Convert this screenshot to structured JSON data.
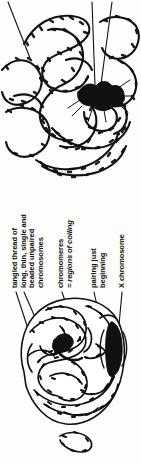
{
  "figure": {
    "ink_color": "#111111",
    "background_color": "#fdfdfb",
    "orientation": "labels rotated 90 degrees counter-clockwise"
  },
  "labels": [
    {
      "id": "tangled",
      "name": "label-tangled-thread",
      "lines": [
        "tangled thread of",
        "long, thin, single and",
        "beaded unpaired",
        "chromosomes"
      ],
      "italic_lines": []
    },
    {
      "id": "chromomeres",
      "name": "label-chromomeres",
      "lines": [
        "chromomeres",
        "= regions of coiling"
      ],
      "italic_lines": [
        1
      ]
    },
    {
      "id": "pairing",
      "name": "label-pairing-just-beginning",
      "lines": [
        "pairing just",
        "beginning"
      ],
      "italic_lines": []
    },
    {
      "id": "xchrom",
      "name": "label-x-chromosome",
      "lines": [
        "X chromosome"
      ],
      "italic_lines": []
    }
  ],
  "diagrams": {
    "upper": {
      "name": "magnified-chromosome-threads",
      "description": "magnified detail of long thin beaded chromosome threads with dark X chromosome mass"
    },
    "lower": {
      "name": "whole-nucleus",
      "description": "whole nucleus packed with tangled beaded chromosome threads and a dark lens-shaped X chromosome at right"
    }
  }
}
